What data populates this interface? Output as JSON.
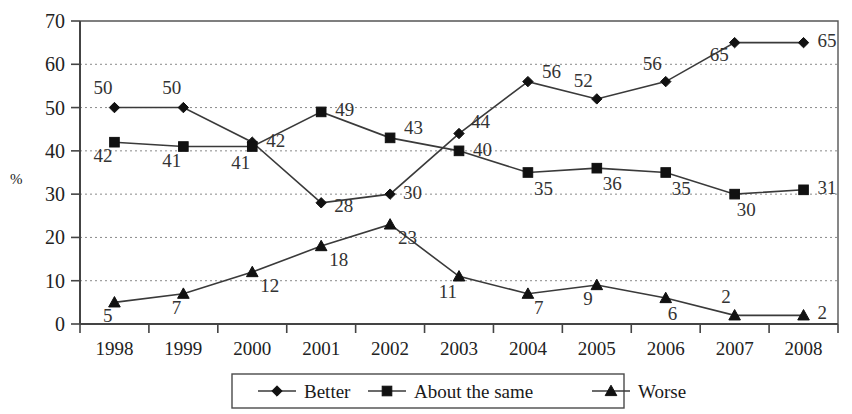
{
  "chart_data": {
    "type": "line",
    "title": "",
    "subtitle": "",
    "xlabel": "",
    "ylabel": "%",
    "categories": [
      "1998",
      "1999",
      "2000",
      "2001",
      "2002",
      "2003",
      "2004",
      "2005",
      "2006",
      "2007",
      "2008"
    ],
    "ylim": [
      0,
      70
    ],
    "yticks": [
      0,
      10,
      20,
      30,
      40,
      50,
      60,
      70
    ],
    "ytick_labels": [
      "0",
      "10",
      "20",
      "30",
      "40",
      "50",
      "60",
      "70"
    ],
    "grid": "horizontal-dotted",
    "legend_position": "bottom-center",
    "series": [
      {
        "name": "Better",
        "marker": "diamond",
        "color": "#111111",
        "values": [
          50,
          50,
          42,
          28,
          30,
          44,
          56,
          52,
          56,
          65,
          65
        ],
        "labels": [
          "50",
          "50",
          "42",
          "28",
          "30",
          "44",
          "56",
          "52",
          "56",
          "65",
          "65"
        ]
      },
      {
        "name": "About the same",
        "marker": "square",
        "color": "#111111",
        "values": [
          42,
          41,
          41,
          49,
          43,
          40,
          35,
          36,
          35,
          30,
          31
        ],
        "labels": [
          "42",
          "41",
          "41",
          "49",
          "43",
          "40",
          "35",
          "36",
          "35",
          "30",
          "31"
        ]
      },
      {
        "name": "Worse",
        "marker": "triangle",
        "color": "#111111",
        "values": [
          5,
          7,
          12,
          18,
          23,
          11,
          7,
          9,
          6,
          2,
          2
        ],
        "labels": [
          "5",
          "7",
          "12",
          "18",
          "23",
          "11",
          "7",
          "9",
          "6",
          "2",
          "2"
        ]
      }
    ]
  },
  "legend": {
    "items": [
      {
        "label": "Better",
        "marker": "diamond"
      },
      {
        "label": "About the same",
        "marker": "square"
      },
      {
        "label": "Worse",
        "marker": "triangle"
      }
    ]
  },
  "axes": {
    "y_axis_title": "%",
    "y_tick_labels": [
      "70",
      "60",
      "50",
      "40",
      "30",
      "20",
      "10",
      "0"
    ],
    "x_tick_labels": [
      "1998",
      "1999",
      "2000",
      "2001",
      "2002",
      "2003",
      "2004",
      "2005",
      "2006",
      "2007",
      "2008"
    ]
  },
  "point_labels": {
    "better": [
      "50",
      "50",
      "42",
      "28",
      "30",
      "44",
      "56",
      "52",
      "56",
      "65",
      "65"
    ],
    "about_the_same": [
      "42",
      "41",
      "41",
      "49",
      "43",
      "40",
      "35",
      "36",
      "35",
      "30",
      "31"
    ],
    "worse": [
      "5",
      "7",
      "12",
      "18",
      "23",
      "11",
      "7",
      "9",
      "6",
      "2",
      "2"
    ]
  },
  "colors": {
    "ink": "#111111",
    "line": "#3a3a3a",
    "grid": "#8a8a8a",
    "border": "#555555",
    "background": "#ffffff"
  }
}
